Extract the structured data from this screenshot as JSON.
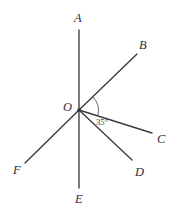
{
  "figure": {
    "type": "geometry-diagram",
    "width": 177,
    "height": 216,
    "background_color": "#ffffff",
    "line_color": "#3a3a42",
    "label_color": "#2b2b33"
  },
  "vertex": {
    "label": "O",
    "x": 79,
    "y": 110,
    "label_x": 63,
    "label_y": 101
  },
  "points": [
    {
      "label": "A",
      "x": 79,
      "y": 30,
      "label_x": 74,
      "label_y": 12
    },
    {
      "label": "B",
      "x": 137,
      "y": 54,
      "label_x": 139,
      "label_y": 39
    },
    {
      "label": "C",
      "x": 152,
      "y": 133,
      "label_x": 157,
      "label_y": 133
    },
    {
      "label": "D",
      "x": 132,
      "y": 160,
      "label_x": 135,
      "label_y": 166
    },
    {
      "label": "E",
      "x": 79,
      "y": 188,
      "label_x": 75,
      "label_y": 193
    },
    {
      "label": "F",
      "x": 25,
      "y": 163,
      "label_x": 13,
      "label_y": 164
    }
  ],
  "rays": [
    {
      "name": "ray-OA",
      "from": "O",
      "to": "A"
    },
    {
      "name": "ray-OB",
      "from": "O",
      "to": "B"
    },
    {
      "name": "ray-OC",
      "from": "O",
      "to": "C"
    },
    {
      "name": "ray-OD",
      "from": "O",
      "to": "D"
    },
    {
      "name": "ray-OE",
      "from": "O",
      "to": "E"
    },
    {
      "name": "ray-OF",
      "from": "O",
      "to": "F"
    }
  ],
  "angles": [
    {
      "name": "angle-BOC",
      "between": [
        "B",
        "C"
      ],
      "value": "35°",
      "label_x": 96,
      "label_y": 118
    }
  ]
}
